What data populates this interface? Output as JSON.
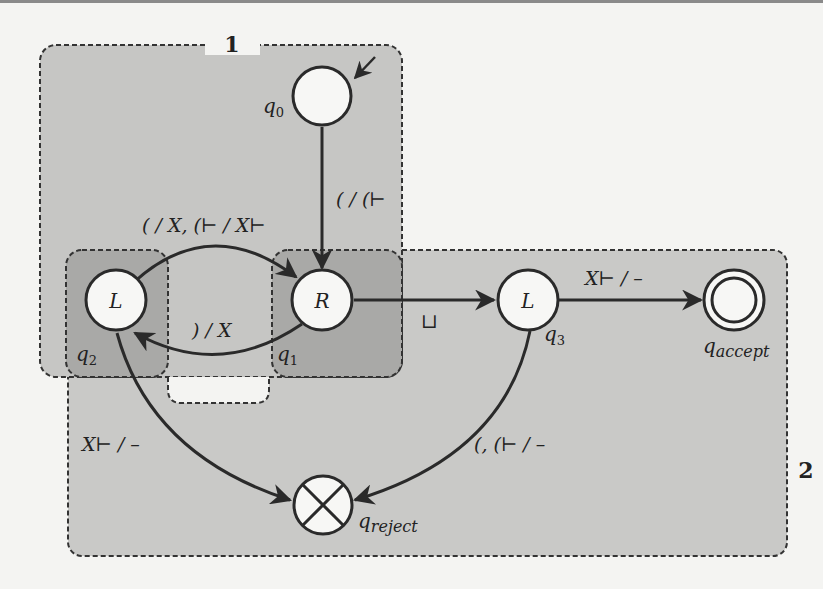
{
  "diagram": {
    "type": "turing-machine-state-diagram",
    "regions": [
      {
        "id": "1",
        "label": "1"
      },
      {
        "id": "2",
        "label": "2"
      }
    ],
    "states": [
      {
        "id": "q0",
        "label": "q0",
        "inner": "",
        "initial": true
      },
      {
        "id": "q1",
        "label": "q1",
        "inner": "R"
      },
      {
        "id": "q2",
        "label": "q2",
        "inner": "L"
      },
      {
        "id": "q3",
        "label": "q3",
        "inner": "L"
      },
      {
        "id": "qaccept",
        "label": "q",
        "sub": "accept",
        "accepting": true
      },
      {
        "id": "qreject",
        "label": "q",
        "sub": "reject",
        "rejecting": true
      }
    ],
    "transitions": [
      {
        "from": "q0",
        "to": "q1",
        "label": "( / (⊢"
      },
      {
        "from": "q2",
        "to": "q1",
        "label": "( / X,  (⊢ / X⊢"
      },
      {
        "from": "q1",
        "to": "q2",
        "label": ") / X"
      },
      {
        "from": "q1",
        "to": "q3",
        "label": "⊔"
      },
      {
        "from": "q3",
        "to": "qaccept",
        "label": "X⊢ / –"
      },
      {
        "from": "q2",
        "to": "qreject",
        "label": "X⊢ / –"
      },
      {
        "from": "q3",
        "to": "qreject",
        "label": "(, (⊢ / –"
      }
    ]
  },
  "colors": {
    "region_light": "#c8c8c6",
    "region_dark": "#a9a9a7",
    "stroke": "#2a2a2a",
    "node_fill": "#f7f7f5"
  }
}
